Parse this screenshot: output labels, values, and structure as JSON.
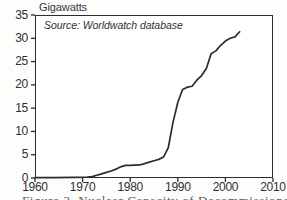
{
  "figure": {
    "axis_title": "Gigawatts",
    "source_note": "Source: Worldwatch database",
    "caption": "Figure 3. Nuclear Capacity of Decommissioned Plants"
  },
  "colors": {
    "line": "#2b2b30",
    "axis": "#2b2b30",
    "text": "#2e2e33",
    "paper": "#fdfdfb",
    "plot_background": "#ffffff"
  },
  "chart_data": {
    "type": "line",
    "title": "Gigawatts",
    "xlabel": "",
    "ylabel": "Gigawatts",
    "xlim": [
      1960,
      2010
    ],
    "ylim": [
      0,
      35
    ],
    "grid": false,
    "legend": "none",
    "annotations": [
      "Source: Worldwatch database"
    ],
    "xticks": [
      1960,
      1970,
      1980,
      1990,
      2000,
      2010
    ],
    "xtick_labels": [
      "1960",
      "1970",
      "1980",
      "1990",
      "2000",
      "2010"
    ],
    "yticks": [
      0,
      5,
      10,
      15,
      20,
      25,
      30,
      35
    ],
    "ytick_labels": [
      "0",
      "5",
      "10",
      "15",
      "20",
      "25",
      "30",
      "35"
    ],
    "series": [
      {
        "name": "Cumulative decommissioned nuclear capacity",
        "x": [
          1960,
          1964,
          1968,
          1971,
          1972,
          1973,
          1974,
          1975,
          1976,
          1977,
          1978,
          1979,
          1980,
          1981,
          1982,
          1983,
          1984,
          1985,
          1986,
          1987,
          1988,
          1989,
          1990,
          1991,
          1992,
          1993,
          1994,
          1995,
          1996,
          1997,
          1998,
          1999,
          2000,
          2001,
          2002,
          2003
        ],
        "y": [
          0.1,
          0.1,
          0.15,
          0.2,
          0.3,
          0.6,
          0.9,
          1.2,
          1.5,
          1.9,
          2.4,
          2.7,
          2.7,
          2.75,
          2.8,
          3.1,
          3.4,
          3.7,
          4.0,
          4.5,
          6.5,
          12.0,
          16.2,
          19.0,
          19.5,
          19.7,
          21.0,
          22.0,
          23.5,
          26.7,
          27.3,
          28.5,
          29.4,
          30.0,
          30.3,
          31.4
        ]
      }
    ]
  },
  "axis_geometry": {
    "plot_left_px": 35,
    "plot_top_px": 15,
    "plot_width_px": 238,
    "plot_height_px": 163
  }
}
